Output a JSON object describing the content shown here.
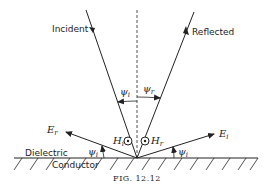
{
  "figure": {
    "caption": "FIG. 12.12",
    "labels": {
      "incident": "Incident",
      "reflected": "Reflected",
      "dielectric": "Dielectric",
      "conductor": "Conductor"
    },
    "field_vectors": {
      "E_r": {
        "base": "E",
        "subscript": "r"
      },
      "E_i": {
        "base": "E",
        "subscript": "i"
      },
      "H_i": {
        "base": "H",
        "subscript": "i",
        "direction": "out-of-page"
      },
      "H_r": {
        "base": "H",
        "subscript": "r",
        "direction": "out-of-page"
      }
    },
    "angles": {
      "psi_i_top": {
        "base": "ψ",
        "subscript": "i"
      },
      "psi_r_top": {
        "base": "ψ",
        "subscript": "r"
      },
      "psi_i_left": {
        "base": "ψ",
        "subscript": "i"
      },
      "psi_i_right": {
        "base": "ψ",
        "subscript": "i"
      }
    },
    "colors": {
      "ink": "#222222",
      "background": "#ffffff"
    }
  }
}
